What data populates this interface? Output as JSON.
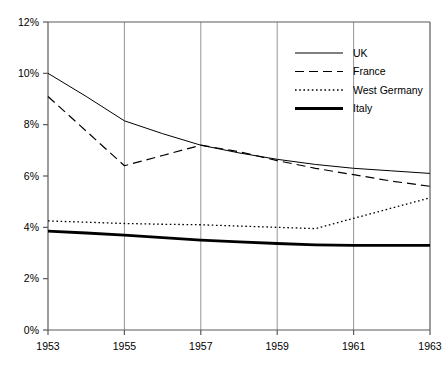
{
  "chart_data": {
    "type": "line",
    "title": "",
    "subtitle": "",
    "xlabel": "",
    "ylabel": "",
    "xlim": [
      1953,
      1963
    ],
    "ylim": [
      0,
      12
    ],
    "grid": "vertical-only",
    "legend_position": "top-right",
    "x": [
      1953,
      1954,
      1955,
      1956,
      1957,
      1958,
      1959,
      1960,
      1961,
      1962,
      1963
    ],
    "xtick_labels": [
      "1953",
      "1955",
      "1957",
      "1959",
      "1961",
      "1963"
    ],
    "xtick_values": [
      1953,
      1955,
      1957,
      1959,
      1961,
      1963
    ],
    "ytick_labels": [
      "0%",
      "2%",
      "4%",
      "6%",
      "8%",
      "10%",
      "12%"
    ],
    "ytick_values": [
      0,
      2,
      4,
      6,
      8,
      10,
      12
    ],
    "series": [
      {
        "name": "UK",
        "style": "solid-thin",
        "values": [
          10.0,
          9.1,
          8.15,
          7.65,
          7.2,
          6.9,
          6.65,
          6.45,
          6.3,
          6.2,
          6.1
        ]
      },
      {
        "name": "France",
        "style": "dashed",
        "values": [
          9.1,
          7.75,
          6.4,
          6.8,
          7.2,
          6.95,
          6.6,
          6.3,
          6.05,
          5.8,
          5.6
        ]
      },
      {
        "name": "West Germany",
        "style": "dotted",
        "values": [
          4.25,
          4.2,
          4.15,
          4.12,
          4.1,
          4.05,
          4.0,
          3.95,
          4.35,
          4.75,
          5.15
        ]
      },
      {
        "name": "Italy",
        "style": "solid-thick",
        "values": [
          3.85,
          3.78,
          3.7,
          3.6,
          3.5,
          3.43,
          3.37,
          3.32,
          3.3,
          3.3,
          3.3
        ]
      }
    ]
  },
  "legend": {
    "items": [
      {
        "label": "UK"
      },
      {
        "label": "France"
      },
      {
        "label": "West Germany"
      },
      {
        "label": "Italy"
      }
    ]
  },
  "colors": {
    "line": "#000000",
    "axis": "#5a5a5a",
    "gridline": "#7a7a7a",
    "background": "#ffffff"
  }
}
